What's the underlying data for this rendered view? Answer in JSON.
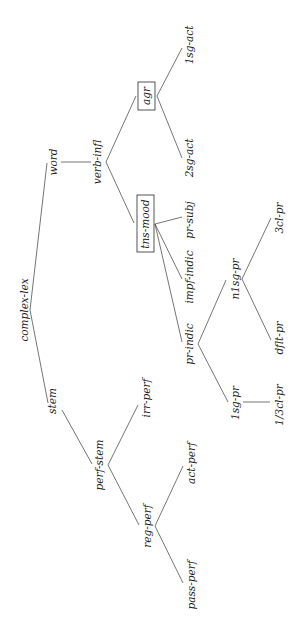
{
  "diagram": {
    "type": "inheritance-tree",
    "orientation": "rotated-90-ccw",
    "root": "complex-lex",
    "nodes": {
      "complex_lex": "complex-lex",
      "word": "word",
      "stem": "stem",
      "verb_infl": "verb-infl",
      "agr": "agr",
      "tns_mood": "tns-mood",
      "sg1_act": "1sg-act",
      "sg2_act": "2sg-act",
      "pr_subj": "pr-subj",
      "impf_indic": "impf-indic",
      "pr_indic": "pr-indic",
      "n1sg_pr": "n1sg-pr",
      "sg1_pr": "1sg-pr",
      "cl3_pr": "3cl-pr",
      "dflt_pr": "dflt-pr",
      "cl13_pr": "1/3cl-pr",
      "perf_stem": "perf-stem",
      "irr_perf": "irr-perf",
      "reg_perf": "reg-perf",
      "act_perf": "act-perf",
      "pass_perf": "pass-perf"
    },
    "boxed_nodes": [
      "agr",
      "tns-mood"
    ],
    "edges": [
      [
        "complex-lex",
        "word"
      ],
      [
        "complex-lex",
        "stem"
      ],
      [
        "word",
        "verb-infl"
      ],
      [
        "verb-infl",
        "agr"
      ],
      [
        "verb-infl",
        "tns-mood"
      ],
      [
        "agr",
        "1sg-act"
      ],
      [
        "agr",
        "2sg-act"
      ],
      [
        "tns-mood",
        "pr-subj"
      ],
      [
        "tns-mood",
        "impf-indic"
      ],
      [
        "tns-mood",
        "pr-indic"
      ],
      [
        "pr-indic",
        "n1sg-pr"
      ],
      [
        "pr-indic",
        "1sg-pr"
      ],
      [
        "n1sg-pr",
        "3cl-pr"
      ],
      [
        "n1sg-pr",
        "dflt-pr"
      ],
      [
        "1sg-pr",
        "1/3cl-pr"
      ],
      [
        "stem",
        "perf-stem"
      ],
      [
        "perf-stem",
        "irr-perf"
      ],
      [
        "perf-stem",
        "reg-perf"
      ],
      [
        "reg-perf",
        "act-perf"
      ],
      [
        "reg-perf",
        "pass-perf"
      ]
    ]
  }
}
